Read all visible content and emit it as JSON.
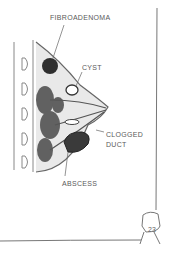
{
  "illustration": {
    "subject": "breast-cross-section",
    "labels": {
      "fibroadenoma": "FIBROADENOMA",
      "cyst": "CYST",
      "clogged_duct_line1": "CLOGGED",
      "clogged_duct_line2": "DUCT",
      "abscess": "ABSCESS"
    }
  },
  "page": {
    "number": "23"
  },
  "colors": {
    "ink": "#555555",
    "shade": "#3a3a3a",
    "paper": "#ffffff"
  }
}
